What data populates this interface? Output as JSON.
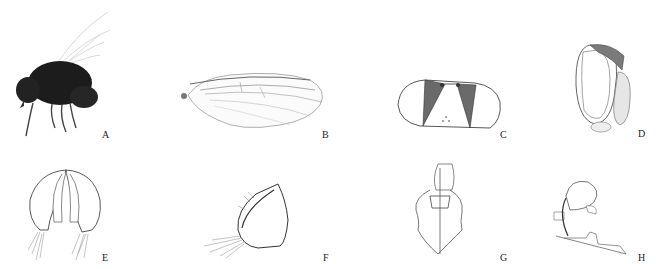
{
  "figure": {
    "panels": [
      {
        "id": "A",
        "label": "A",
        "subject": "whole fly, lateral habitus (photograph)"
      },
      {
        "id": "B",
        "label": "B",
        "subject": "wing"
      },
      {
        "id": "C",
        "label": "C",
        "subject": "head, frontal view"
      },
      {
        "id": "D",
        "label": "D",
        "subject": "head, lateral view"
      },
      {
        "id": "E",
        "label": "E",
        "subject": "male terminalia, posterior view"
      },
      {
        "id": "F",
        "label": "F",
        "subject": "surstylus, lateral view"
      },
      {
        "id": "G",
        "label": "G",
        "subject": "hypandrium and aedeagal apodeme, ventral view"
      },
      {
        "id": "H",
        "label": "H",
        "subject": "aedeagus, lateral view"
      }
    ]
  }
}
